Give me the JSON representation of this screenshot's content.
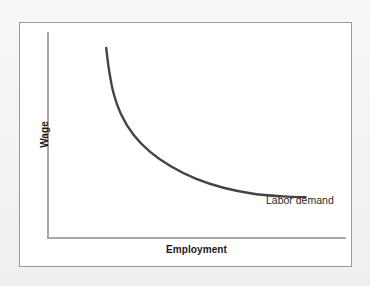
{
  "figure": {
    "panel_background": "#ffffff",
    "panel_border_color": "#9a9a9a",
    "page_background": "#f4f4f4"
  },
  "chart_data": {
    "type": "line",
    "title": "",
    "subtitle": "",
    "xlabel": "Employment",
    "ylabel": "Wage",
    "grid": false,
    "legend_position": "inline-right-end-of-curve",
    "axis_ticks": [],
    "xlim": [
      0,
      1
    ],
    "ylim": [
      0,
      1
    ],
    "annotations": [
      {
        "text": "Labor demand",
        "anchor": "end-of-curve",
        "color": "#2b2b2b"
      }
    ],
    "series": [
      {
        "name": "Labor demand",
        "color": "#444444",
        "line_width": 2.4,
        "shape": "downward-sloping convex hyperbola",
        "points": [
          {
            "x": 0.198,
            "y": 0.923
          },
          {
            "x": 0.207,
            "y": 0.82
          },
          {
            "x": 0.222,
            "y": 0.706
          },
          {
            "x": 0.248,
            "y": 0.6
          },
          {
            "x": 0.29,
            "y": 0.5
          },
          {
            "x": 0.345,
            "y": 0.418
          },
          {
            "x": 0.414,
            "y": 0.348
          },
          {
            "x": 0.497,
            "y": 0.288
          },
          {
            "x": 0.59,
            "y": 0.244
          },
          {
            "x": 0.69,
            "y": 0.215
          },
          {
            "x": 0.79,
            "y": 0.202
          },
          {
            "x": 0.865,
            "y": 0.198
          }
        ]
      }
    ]
  },
  "axes": {
    "y_axis_color": "#a8a8a8",
    "x_axis_color": "#a8a8a8"
  },
  "labels": {
    "y_axis": "Wage",
    "x_axis": "Employment",
    "curve": "Labor demand"
  }
}
